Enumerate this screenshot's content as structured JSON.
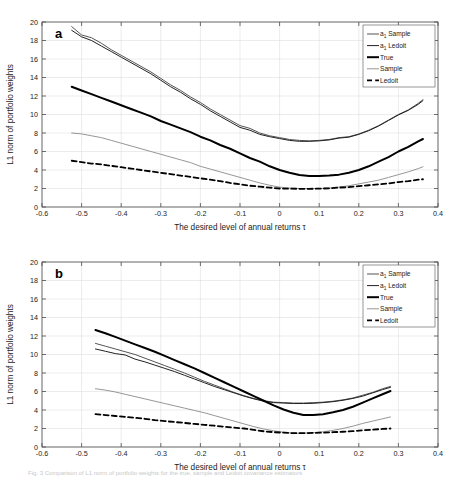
{
  "figure": {
    "panel_a_letter": "a",
    "panel_b_letter": "b",
    "caption": "Fig. 3  Comparison of L1 norm of portfolio weights for the true, sample and Ledoit covariance estimators"
  },
  "axis": {
    "xlabel": "The desired level of annual returns τ",
    "ylabel": "L1 norm of portfolio weights",
    "xticks": [
      "-0.6",
      "-0.5",
      "-0.4",
      "-0.3",
      "-0.2",
      "-0.1",
      "0",
      "0.1",
      "0.2",
      "0.3",
      "0.4"
    ],
    "yticks": [
      "0",
      "2",
      "4",
      "6",
      "8",
      "10",
      "12",
      "14",
      "16",
      "18",
      "20"
    ]
  },
  "legend": {
    "items": [
      {
        "label": "a",
        "sub": "1",
        "rest": " Sample",
        "style": "thin-gray"
      },
      {
        "label": "a",
        "sub": "1",
        "rest": " Ledoit",
        "style": "thin-dark"
      },
      {
        "label": "True",
        "sub": "",
        "rest": "",
        "style": "thick-black"
      },
      {
        "label": "Sample",
        "sub": "",
        "rest": "",
        "style": "thin-light"
      },
      {
        "label": "Ledoit",
        "sub": "",
        "rest": "",
        "style": "dashed-black"
      }
    ]
  },
  "colors": {
    "a1_sample": "#555555",
    "a1_ledoit": "#222222",
    "true": "#000000",
    "sample": "#8a8a8a",
    "ledoit": "#000000",
    "grid": "#d8d8d8",
    "axis": "#4d4d4d"
  },
  "chart_data": [
    {
      "id": "panel-a",
      "type": "line",
      "title": "a",
      "xlabel": "The desired level of annual returns τ",
      "ylabel": "L1 norm of portfolio weights",
      "xlim": [
        -0.6,
        0.4
      ],
      "ylim": [
        0,
        20
      ],
      "xtick_step": 0.1,
      "ytick_step": 2,
      "grid": true,
      "legend_position": "top-right",
      "x": [
        -0.525,
        -0.5,
        -0.475,
        -0.45,
        -0.425,
        -0.4,
        -0.375,
        -0.35,
        -0.325,
        -0.3,
        -0.275,
        -0.25,
        -0.225,
        -0.2,
        -0.175,
        -0.15,
        -0.125,
        -0.1,
        -0.075,
        -0.05,
        -0.025,
        0,
        0.025,
        0.05,
        0.075,
        0.1,
        0.125,
        0.15,
        0.175,
        0.2,
        0.225,
        0.25,
        0.275,
        0.3,
        0.325,
        0.35,
        0.362
      ],
      "series": [
        {
          "name": "a_1 Sample",
          "values": [
            19.5,
            18.6,
            18.3,
            17.7,
            17.0,
            16.4,
            15.8,
            15.2,
            14.6,
            13.9,
            13.2,
            12.6,
            11.9,
            11.3,
            10.6,
            10.0,
            9.4,
            8.8,
            8.5,
            8.0,
            7.7,
            7.5,
            7.3,
            7.2,
            7.15,
            7.2,
            7.3,
            7.5,
            7.6,
            7.9,
            8.3,
            8.8,
            9.4,
            10.0,
            10.5,
            11.2,
            11.6
          ]
        },
        {
          "name": "a_1 Ledoit",
          "values": [
            19.1,
            18.4,
            18.0,
            17.4,
            16.8,
            16.2,
            15.6,
            15.0,
            14.4,
            13.7,
            13.0,
            12.4,
            11.7,
            11.1,
            10.4,
            9.8,
            9.2,
            8.6,
            8.3,
            7.85,
            7.6,
            7.4,
            7.2,
            7.1,
            7.1,
            7.15,
            7.25,
            7.45,
            7.55,
            7.85,
            8.25,
            8.75,
            9.35,
            9.95,
            10.45,
            11.1,
            11.5
          ]
        },
        {
          "name": "True",
          "values": [
            13.0,
            12.6,
            12.2,
            11.8,
            11.4,
            11.0,
            10.6,
            10.2,
            9.8,
            9.3,
            8.9,
            8.5,
            8.1,
            7.6,
            7.2,
            6.7,
            6.3,
            5.8,
            5.3,
            4.9,
            4.4,
            4.0,
            3.7,
            3.45,
            3.35,
            3.35,
            3.4,
            3.5,
            3.7,
            4.0,
            4.4,
            4.9,
            5.4,
            6.0,
            6.5,
            7.1,
            7.35
          ]
        },
        {
          "name": "Sample",
          "values": [
            8.0,
            7.9,
            7.7,
            7.5,
            7.2,
            6.9,
            6.6,
            6.3,
            6.0,
            5.7,
            5.4,
            5.1,
            4.8,
            4.4,
            4.1,
            3.8,
            3.5,
            3.2,
            2.9,
            2.6,
            2.35,
            2.15,
            2.05,
            2.0,
            1.98,
            2.0,
            2.05,
            2.15,
            2.3,
            2.5,
            2.7,
            2.9,
            3.2,
            3.5,
            3.8,
            4.15,
            4.35
          ]
        },
        {
          "name": "Ledoit",
          "values": [
            5.0,
            4.85,
            4.7,
            4.6,
            4.45,
            4.3,
            4.15,
            4.0,
            3.85,
            3.7,
            3.55,
            3.4,
            3.25,
            3.1,
            2.95,
            2.8,
            2.6,
            2.45,
            2.3,
            2.2,
            2.1,
            2.0,
            1.98,
            1.97,
            1.97,
            1.98,
            2.02,
            2.1,
            2.15,
            2.25,
            2.35,
            2.45,
            2.55,
            2.7,
            2.8,
            2.95,
            3.0
          ]
        }
      ]
    },
    {
      "id": "panel-b",
      "type": "line",
      "title": "b",
      "xlabel": "The desired level of annual returns τ",
      "ylabel": "L1 norm of portfolio weights",
      "xlim": [
        -0.6,
        0.4
      ],
      "ylim": [
        0,
        20
      ],
      "xtick_step": 0.1,
      "ytick_step": 2,
      "grid": true,
      "legend_position": "top-right",
      "x": [
        -0.465,
        -0.44,
        -0.415,
        -0.39,
        -0.365,
        -0.34,
        -0.315,
        -0.29,
        -0.265,
        -0.24,
        -0.215,
        -0.19,
        -0.165,
        -0.14,
        -0.115,
        -0.09,
        -0.065,
        -0.04,
        -0.015,
        0.01,
        0.035,
        0.06,
        0.085,
        0.11,
        0.135,
        0.16,
        0.185,
        0.21,
        0.235,
        0.26,
        0.28
      ],
      "series": [
        {
          "name": "a_1 Sample",
          "values": [
            11.2,
            10.9,
            10.6,
            10.3,
            10.0,
            9.6,
            9.2,
            8.8,
            8.4,
            8.0,
            7.55,
            7.1,
            6.7,
            6.3,
            5.9,
            5.55,
            5.25,
            5.0,
            4.85,
            4.8,
            4.75,
            4.75,
            4.8,
            4.85,
            4.95,
            5.1,
            5.3,
            5.6,
            5.9,
            6.3,
            6.55
          ]
        },
        {
          "name": "a_1 Ledoit",
          "values": [
            10.6,
            10.35,
            10.1,
            9.95,
            9.5,
            9.2,
            8.85,
            8.5,
            8.15,
            7.75,
            7.35,
            6.95,
            6.55,
            6.2,
            5.85,
            5.5,
            5.2,
            4.95,
            4.8,
            4.75,
            4.7,
            4.7,
            4.72,
            4.8,
            4.9,
            5.05,
            5.25,
            5.5,
            5.85,
            6.2,
            6.45
          ]
        },
        {
          "name": "True",
          "values": [
            12.65,
            12.3,
            11.9,
            11.5,
            11.1,
            10.7,
            10.3,
            9.85,
            9.4,
            8.95,
            8.5,
            8.0,
            7.5,
            7.0,
            6.5,
            6.0,
            5.5,
            5.0,
            4.5,
            4.05,
            3.7,
            3.45,
            3.45,
            3.55,
            3.75,
            4.0,
            4.35,
            4.8,
            5.25,
            5.7,
            6.05
          ]
        },
        {
          "name": "Sample",
          "values": [
            6.3,
            6.15,
            5.95,
            5.7,
            5.45,
            5.2,
            4.95,
            4.7,
            4.45,
            4.2,
            3.95,
            3.7,
            3.4,
            3.1,
            2.8,
            2.5,
            2.2,
            1.95,
            1.75,
            1.6,
            1.5,
            1.5,
            1.55,
            1.65,
            1.8,
            2.0,
            2.25,
            2.55,
            2.8,
            3.05,
            3.25
          ]
        },
        {
          "name": "Ledoit",
          "values": [
            3.55,
            3.45,
            3.35,
            3.25,
            3.15,
            3.05,
            2.9,
            2.8,
            2.7,
            2.6,
            2.5,
            2.4,
            2.3,
            2.2,
            2.1,
            2.0,
            1.85,
            1.7,
            1.6,
            1.55,
            1.5,
            1.5,
            1.52,
            1.55,
            1.6,
            1.65,
            1.72,
            1.8,
            1.88,
            1.95,
            2.0
          ]
        }
      ]
    }
  ]
}
